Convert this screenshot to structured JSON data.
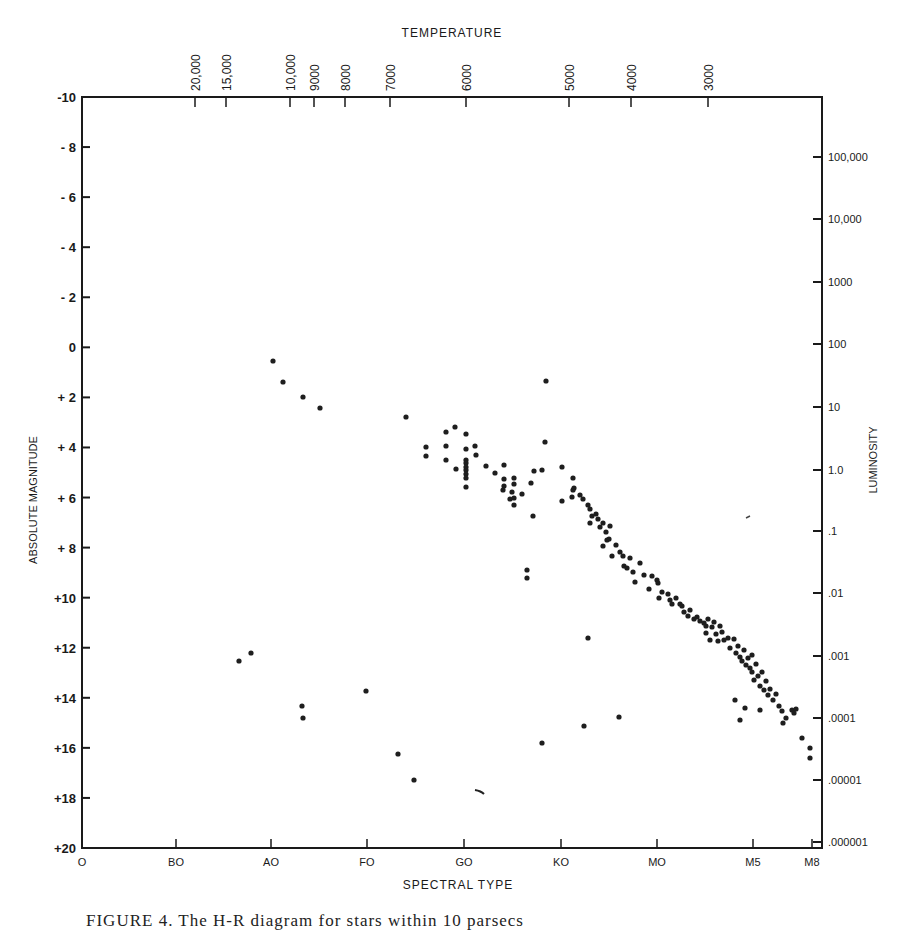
{
  "chart_data": {
    "type": "scatter",
    "title": "",
    "top_axis_title": "TEMPERATURE",
    "xlabel": "SPECTRAL TYPE",
    "ylabel": "ABSOLUTE MAGNITUDE",
    "y2label": "LUMINOSITY",
    "ylim": [
      20,
      -10
    ],
    "grid": false,
    "legend": null,
    "x_ticks": [
      {
        "label": "O",
        "px": 82
      },
      {
        "label": "BO",
        "px": 176
      },
      {
        "label": "AO",
        "px": 271
      },
      {
        "label": "FO",
        "px": 367
      },
      {
        "label": "GO",
        "px": 464
      },
      {
        "label": "KO",
        "px": 561
      },
      {
        "label": "MO",
        "px": 657
      },
      {
        "label": "M5",
        "px": 753
      },
      {
        "label": "M8",
        "px": 812
      }
    ],
    "top_ticks": [
      {
        "label": "20,000",
        "px": 195
      },
      {
        "label": "15,000",
        "px": 226
      },
      {
        "label": "10,000",
        "px": 290
      },
      {
        "label": "9000",
        "px": 314
      },
      {
        "label": "8000",
        "px": 345
      },
      {
        "label": "7000",
        "px": 390
      },
      {
        "label": "6000",
        "px": 466
      },
      {
        "label": "5000",
        "px": 569
      },
      {
        "label": "4000",
        "px": 631
      },
      {
        "label": "3000",
        "px": 708
      }
    ],
    "y_ticks": [
      {
        "label": "-10",
        "value": -10
      },
      {
        "label": "- 8",
        "value": -8
      },
      {
        "label": "- 6",
        "value": -6
      },
      {
        "label": "- 4",
        "value": -4
      },
      {
        "label": "- 2",
        "value": -2
      },
      {
        "label": "0",
        "value": 0
      },
      {
        "label": "+ 2",
        "value": 2
      },
      {
        "label": "+ 4",
        "value": 4
      },
      {
        "label": "+ 6",
        "value": 6
      },
      {
        "label": "+ 8",
        "value": 8
      },
      {
        "label": "+10",
        "value": 10
      },
      {
        "label": "+12",
        "value": 12
      },
      {
        "label": "+14",
        "value": 14
      },
      {
        "label": "+16",
        "value": 16
      },
      {
        "label": "+18",
        "value": 18
      },
      {
        "label": "+20",
        "value": 20
      }
    ],
    "y2_ticks": [
      {
        "label": "100,000",
        "px": 157
      },
      {
        "label": "10,000",
        "px": 219
      },
      {
        "label": "1000",
        "px": 282
      },
      {
        "label": "100",
        "px": 344
      },
      {
        "label": "10",
        "px": 407
      },
      {
        "label": "1.0",
        "px": 470
      },
      {
        "label": ".1",
        "px": 531
      },
      {
        "label": ".01",
        "px": 593
      },
      {
        "label": ".001",
        "px": 656
      },
      {
        "label": ".0001",
        "px": 718
      },
      {
        "label": ".00001",
        "px": 780
      },
      {
        "label": ".000001",
        "px": 842
      }
    ],
    "frame": {
      "left": 82,
      "right": 822,
      "top": 97,
      "bottom": 848
    },
    "points_px": [
      [
        273,
        361
      ],
      [
        283,
        382
      ],
      [
        303,
        397
      ],
      [
        320,
        408
      ],
      [
        406,
        417
      ],
      [
        426,
        447
      ],
      [
        426,
        456
      ],
      [
        446,
        432
      ],
      [
        446,
        446
      ],
      [
        446,
        460
      ],
      [
        455,
        427
      ],
      [
        466,
        434
      ],
      [
        466,
        449
      ],
      [
        466,
        460
      ],
      [
        466,
        463
      ],
      [
        466,
        467
      ],
      [
        466,
        470
      ],
      [
        466,
        474
      ],
      [
        466,
        478
      ],
      [
        466,
        487
      ],
      [
        475,
        446
      ],
      [
        476,
        455
      ],
      [
        456,
        469
      ],
      [
        486,
        466
      ],
      [
        495,
        473
      ],
      [
        504,
        465
      ],
      [
        504,
        479
      ],
      [
        504,
        486
      ],
      [
        503,
        490
      ],
      [
        514,
        478
      ],
      [
        514,
        484
      ],
      [
        512,
        492
      ],
      [
        510,
        499
      ],
      [
        514,
        498
      ],
      [
        514,
        505
      ],
      [
        522,
        494
      ],
      [
        531,
        483
      ],
      [
        534,
        471
      ],
      [
        542,
        470
      ],
      [
        545,
        442
      ],
      [
        533,
        516
      ],
      [
        546,
        381
      ],
      [
        562,
        467
      ],
      [
        562,
        501
      ],
      [
        573,
        478
      ],
      [
        573,
        490
      ],
      [
        572,
        497
      ],
      [
        574,
        488
      ],
      [
        580,
        495
      ],
      [
        583,
        499
      ],
      [
        588,
        505
      ],
      [
        590,
        509
      ],
      [
        592,
        516
      ],
      [
        590,
        523
      ],
      [
        596,
        514
      ],
      [
        598,
        519
      ],
      [
        600,
        527
      ],
      [
        603,
        523
      ],
      [
        606,
        532
      ],
      [
        607,
        540
      ],
      [
        610,
        526
      ],
      [
        603,
        546
      ],
      [
        609,
        539
      ],
      [
        612,
        556
      ],
      [
        616,
        545
      ],
      [
        620,
        552
      ],
      [
        623,
        556
      ],
      [
        624,
        566
      ],
      [
        627,
        568
      ],
      [
        630,
        558
      ],
      [
        633,
        572
      ],
      [
        635,
        582
      ],
      [
        640,
        563
      ],
      [
        644,
        575
      ],
      [
        649,
        589
      ],
      [
        652,
        576
      ],
      [
        657,
        580
      ],
      [
        658,
        583
      ],
      [
        659,
        598
      ],
      [
        662,
        592
      ],
      [
        668,
        594
      ],
      [
        670,
        600
      ],
      [
        672,
        604
      ],
      [
        676,
        598
      ],
      [
        680,
        604
      ],
      [
        682,
        606
      ],
      [
        684,
        612
      ],
      [
        688,
        616
      ],
      [
        690,
        610
      ],
      [
        694,
        619
      ],
      [
        697,
        617
      ],
      [
        700,
        621
      ],
      [
        704,
        623
      ],
      [
        706,
        626
      ],
      [
        708,
        619
      ],
      [
        712,
        627
      ],
      [
        714,
        622
      ],
      [
        716,
        634
      ],
      [
        720,
        626
      ],
      [
        722,
        632
      ],
      [
        706,
        633
      ],
      [
        710,
        640
      ],
      [
        718,
        641
      ],
      [
        724,
        640
      ],
      [
        728,
        638
      ],
      [
        730,
        648
      ],
      [
        734,
        639
      ],
      [
        736,
        653
      ],
      [
        738,
        646
      ],
      [
        740,
        657
      ],
      [
        742,
        661
      ],
      [
        744,
        650
      ],
      [
        746,
        665
      ],
      [
        748,
        658
      ],
      [
        750,
        668
      ],
      [
        752,
        655
      ],
      [
        752,
        672
      ],
      [
        754,
        680
      ],
      [
        756,
        664
      ],
      [
        758,
        676
      ],
      [
        760,
        686
      ],
      [
        762,
        672
      ],
      [
        764,
        690
      ],
      [
        766,
        681
      ],
      [
        768,
        695
      ],
      [
        770,
        689
      ],
      [
        773,
        700
      ],
      [
        776,
        694
      ],
      [
        779,
        706
      ],
      [
        782,
        711
      ],
      [
        786,
        718
      ],
      [
        783,
        723
      ],
      [
        792,
        710
      ],
      [
        796,
        709
      ],
      [
        794,
        713
      ],
      [
        802,
        738
      ],
      [
        810,
        748
      ],
      [
        810,
        758
      ],
      [
        760,
        710
      ],
      [
        740,
        720
      ],
      [
        745,
        708
      ],
      [
        735,
        700
      ],
      [
        527,
        570
      ],
      [
        527,
        578
      ],
      [
        619,
        717
      ],
      [
        584,
        726
      ],
      [
        302,
        706
      ],
      [
        303,
        718
      ],
      [
        398,
        754
      ],
      [
        251,
        653
      ],
      [
        239,
        661
      ],
      [
        366,
        691
      ],
      [
        588,
        638
      ],
      [
        542,
        743
      ],
      [
        414,
        780
      ]
    ]
  },
  "page": {
    "caption": "FIGURE 4.   The H-R diagram for stars within 10 parsecs"
  }
}
